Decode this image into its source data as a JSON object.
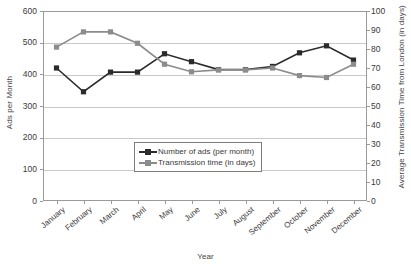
{
  "chart_data": {
    "type": "line",
    "title": "",
    "xlabel": "Year",
    "categories": [
      "January",
      "February",
      "March",
      "April",
      "May",
      "June",
      "July",
      "August",
      "September",
      "October",
      "November",
      "December"
    ],
    "grid": true,
    "legend_position": "inside-center-bottom",
    "axes": {
      "left": {
        "label": "Ads per Month",
        "ticks": [
          "0",
          "100",
          "200",
          "300",
          "400",
          "500",
          "600"
        ],
        "min": 0,
        "max": 600,
        "step": 100
      },
      "right": {
        "label": "Average Transmission Time from London (in days)",
        "ticks": [
          "0",
          "10",
          "20",
          "30",
          "40",
          "50",
          "60",
          "70",
          "80",
          "90",
          "100"
        ],
        "min": 0,
        "max": 100,
        "step": 10
      }
    },
    "series": [
      {
        "name": "Number of ads (per month)",
        "axis": "left",
        "color": "#2b2b2b",
        "marker": "square",
        "values": [
          420,
          345,
          407,
          407,
          465,
          440,
          415,
          415,
          425,
          468,
          490,
          445
        ]
      },
      {
        "name": "Transmission time (in days)",
        "axis": "right",
        "color": "#8c8c8c",
        "marker": "square",
        "values": [
          81,
          89,
          89,
          83,
          72,
          68,
          69,
          69,
          70,
          66,
          65,
          72
        ]
      }
    ]
  },
  "legend": {
    "items": [
      {
        "label": "Number of ads (per month)"
      },
      {
        "label": "Transmission time (in days)"
      }
    ]
  }
}
